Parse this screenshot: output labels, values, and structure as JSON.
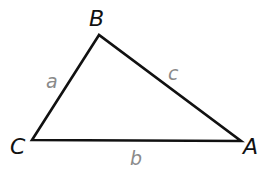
{
  "diagram": {
    "type": "triangle",
    "stroke_color": "#111111",
    "vertex_label_color": "#111111",
    "side_label_color": "#8a8a8a",
    "vertices": [
      {
        "id": "B",
        "label": "B",
        "x": 99,
        "y": 35
      },
      {
        "id": "C",
        "label": "C",
        "x": 32,
        "y": 140
      },
      {
        "id": "A",
        "label": "A",
        "x": 241,
        "y": 141
      }
    ],
    "sides": [
      {
        "id": "a",
        "label": "a",
        "from": "C",
        "to": "B"
      },
      {
        "id": "c",
        "label": "c",
        "from": "B",
        "to": "A"
      },
      {
        "id": "b",
        "label": "b",
        "from": "C",
        "to": "A"
      }
    ]
  }
}
